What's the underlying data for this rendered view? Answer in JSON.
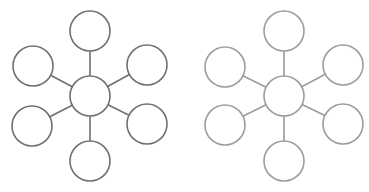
{
  "canvas": {
    "width": 369,
    "height": 192,
    "background": "#ffffff"
  },
  "diagrams": [
    {
      "name": "hub-diagram-dark",
      "stroke": "#707070",
      "radius": 20,
      "hub": {
        "cx": 90,
        "cy": 96,
        "label": ""
      },
      "satellites": [
        {
          "name": "top",
          "cx": 90,
          "cy": 31,
          "label": ""
        },
        {
          "name": "upper-right",
          "cx": 147,
          "cy": 65,
          "label": ""
        },
        {
          "name": "lower-right",
          "cx": 147,
          "cy": 124,
          "label": ""
        },
        {
          "name": "bottom",
          "cx": 90,
          "cy": 161,
          "label": ""
        },
        {
          "name": "lower-left",
          "cx": 32,
          "cy": 126,
          "label": ""
        },
        {
          "name": "upper-left",
          "cx": 33,
          "cy": 66,
          "label": ""
        }
      ]
    },
    {
      "name": "hub-diagram-light",
      "stroke": "#9c9c9c",
      "radius": 20,
      "hub": {
        "cx": 284,
        "cy": 96,
        "label": ""
      },
      "satellites": [
        {
          "name": "top",
          "cx": 284,
          "cy": 31,
          "label": ""
        },
        {
          "name": "upper-right",
          "cx": 343,
          "cy": 65,
          "label": ""
        },
        {
          "name": "lower-right",
          "cx": 343,
          "cy": 124,
          "label": ""
        },
        {
          "name": "bottom",
          "cx": 284,
          "cy": 161,
          "label": ""
        },
        {
          "name": "lower-left",
          "cx": 225,
          "cy": 125,
          "label": ""
        },
        {
          "name": "upper-left",
          "cx": 225,
          "cy": 67,
          "label": ""
        }
      ]
    }
  ]
}
